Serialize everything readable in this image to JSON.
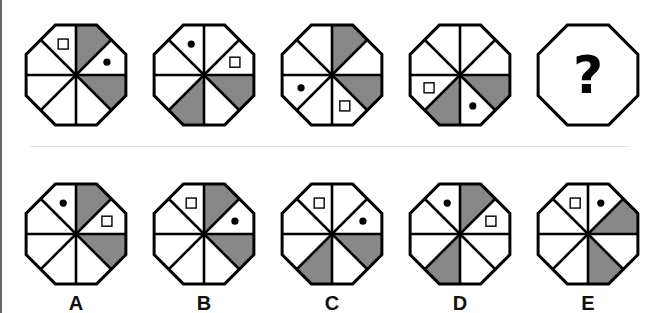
{
  "puzzle": {
    "sector_order": "clockwise from 12 o'clock: 0=top-right,1=right-upper,2=right-lower,3=bottom-right,4=bottom-left,5=left-lower,6=left-upper,7=top-left",
    "colors": {
      "shade": "#888888",
      "stroke": "#000000",
      "fill": "#ffffff"
    },
    "sequence": [
      {
        "shaded": [
          0,
          2
        ],
        "square": 7,
        "dot": 1
      },
      {
        "shaded": [
          2,
          4
        ],
        "square": 1,
        "dot": 7
      },
      {
        "shaded": [
          0,
          2
        ],
        "square": 3,
        "dot": 5
      },
      {
        "shaded": [
          2,
          4
        ],
        "square": 5,
        "dot": 3
      },
      {
        "unknown": true,
        "text": "?"
      }
    ],
    "options": [
      {
        "label": "A",
        "shaded": [
          0,
          2
        ],
        "square": 1,
        "dot": 7
      },
      {
        "label": "B",
        "shaded": [
          0,
          2
        ],
        "square": 7,
        "dot": 1
      },
      {
        "label": "C",
        "shaded": [
          2,
          4
        ],
        "square": 7,
        "dot": 1
      },
      {
        "label": "D",
        "shaded": [
          0,
          4
        ],
        "square": 1,
        "dot": 7
      },
      {
        "label": "E",
        "shaded": [
          1,
          3
        ],
        "square": 7,
        "dot": 0
      }
    ]
  }
}
